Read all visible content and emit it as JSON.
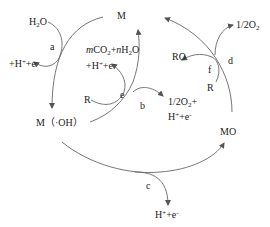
{
  "nodes": {
    "M": "M",
    "M_OH": "M（·OH）",
    "MO": "MO"
  },
  "steps": {
    "a": "a",
    "b": "b",
    "c": "c",
    "d": "d",
    "e": "e",
    "f": "f"
  },
  "species": {
    "h2o_a": "H2O",
    "proton_electron_a": "+H⁺+e⁻",
    "mineralization_products": "mCO2+nH2O +H⁺+e⁻",
    "r_e": "R",
    "o2_b": "1/2O2+ H⁺+e⁻",
    "proton_electron_c": "H⁺+e⁻",
    "o2_d": "1/2O2",
    "ro_f": "RO",
    "r_f": "R"
  },
  "colors": {
    "line": "#555555",
    "text": "#222222"
  }
}
